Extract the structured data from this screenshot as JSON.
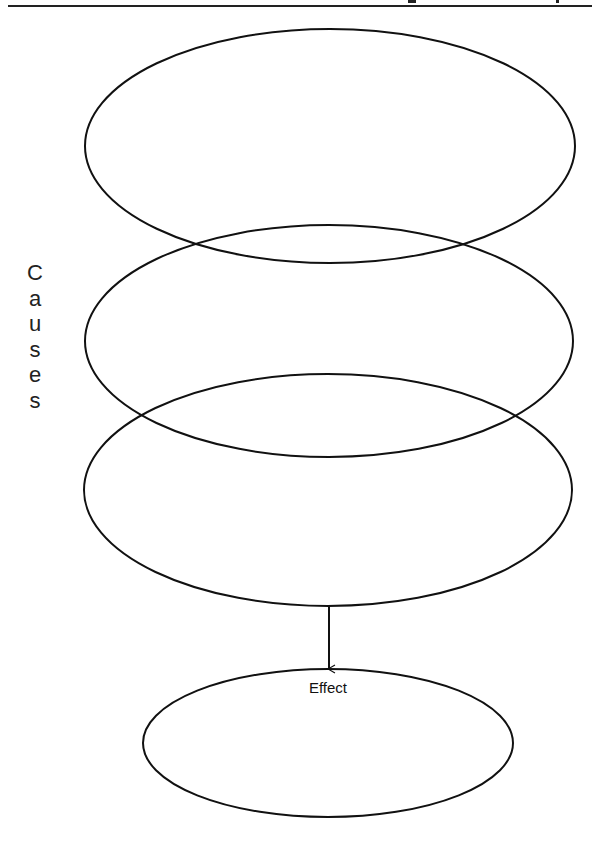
{
  "header": {
    "rule": true
  },
  "side_label": {
    "text": "Causes",
    "letters": [
      "C",
      "a",
      "u",
      "s",
      "e",
      "s"
    ]
  },
  "cause_ellipses": [
    {
      "id": "cause-1",
      "cx": 330,
      "cy": 146,
      "rx": 245,
      "ry": 117
    },
    {
      "id": "cause-2",
      "cx": 329,
      "cy": 341,
      "rx": 244,
      "ry": 116
    },
    {
      "id": "cause-3",
      "cx": 328,
      "cy": 490,
      "rx": 244,
      "ry": 116
    }
  ],
  "arrow": {
    "x": 329,
    "y1": 606,
    "y2": 669
  },
  "effect": {
    "label": "Effect",
    "cx": 328,
    "cy": 743,
    "rx": 185,
    "ry": 74
  },
  "colors": {
    "stroke": "#111111",
    "background": "#ffffff"
  }
}
